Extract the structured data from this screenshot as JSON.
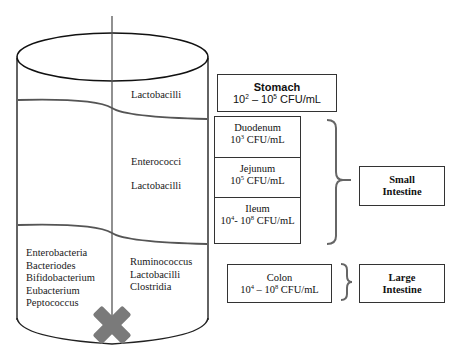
{
  "diagram": {
    "type": "gut-microbiota-cylinder",
    "colors": {
      "line": "#222222",
      "divider": "#555555",
      "cross": "#7a7a7a",
      "box_border": "#333333"
    },
    "cylinder": {
      "upper_section": {
        "right_label": "Lactobacilli"
      },
      "middle_section": {
        "right_labels": [
          "Enterococci",
          "Lactobacilli"
        ]
      },
      "lower_section": {
        "left_labels": [
          "Enterobacteria",
          "Bacteriodes",
          "Bifidobacterium",
          "Eubacterium",
          "Peptococcus"
        ],
        "right_labels": [
          "Ruminococcus",
          "Lactobacilli",
          "Clostridia"
        ]
      },
      "bottom_icon": "cross-icon"
    },
    "stomach": {
      "title": "Stomach",
      "base1": "10",
      "exp1": "2",
      "sep": " – ",
      "base2": "10",
      "exp2": "5",
      "unit": " CFU/mL"
    },
    "small_intestine_segments": [
      {
        "title": "Duodenum",
        "base1": "10",
        "exp1": "3",
        "sep": "",
        "base2": "",
        "exp2": "",
        "unit": " CFU/mL"
      },
      {
        "title": "Jejunum",
        "base1": "10",
        "exp1": "5",
        "sep": "",
        "base2": "",
        "exp2": "",
        "unit": " CFU/mL"
      },
      {
        "title": "Ileum",
        "base1": "10",
        "exp1": "4",
        "sep": "- ",
        "base2": "10",
        "exp2": "8",
        "unit": " CFU/mL"
      }
    ],
    "colon": {
      "title": "Colon",
      "base1": "10",
      "exp1": "4",
      "sep": " – ",
      "base2": "10",
      "exp2": "8",
      "unit": " CFU/mL"
    },
    "regions": {
      "small_intestine": {
        "line1": "Small",
        "line2": "Intestine"
      },
      "large_intestine": {
        "line1": "Large",
        "line2": "Intestine"
      }
    }
  }
}
